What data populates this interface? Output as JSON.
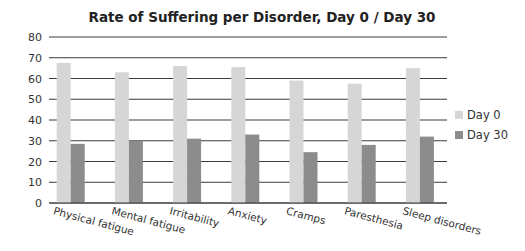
{
  "chart_data": {
    "type": "bar",
    "title": "Rate of Suffering per Disorder, Day 0 / Day 30",
    "xlabel": "",
    "ylabel": "",
    "ylim": [
      0,
      80
    ],
    "yticks": [
      0,
      10,
      20,
      30,
      40,
      50,
      60,
      70,
      80
    ],
    "grid": true,
    "legend_position": "right",
    "categories": [
      "Physical fatigue",
      "Mental fatigue",
      "Irritability",
      "Anxiety",
      "Cramps",
      "Paresthesia",
      "Sleep disorders"
    ],
    "series": [
      {
        "name": "Day 0",
        "color": "#d6d6d6",
        "values": [
          67.5,
          63,
          66,
          65.5,
          59,
          57.5,
          65
        ]
      },
      {
        "name": "Day 30",
        "color": "#8c8c8c",
        "values": [
          28.5,
          30,
          31,
          33,
          24.5,
          28,
          32
        ]
      }
    ]
  }
}
